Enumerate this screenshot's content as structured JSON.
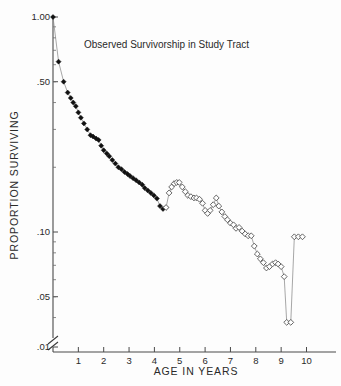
{
  "chart_data": {
    "type": "line",
    "title": "Observed Survivorship in Study Tract",
    "xlabel": "AGE IN YEARS",
    "ylabel": "PROPORTION SURVIVING",
    "xlim": [
      0,
      10.6
    ],
    "ylim": [
      0.01,
      1.0
    ],
    "yscale": "log",
    "grid": false,
    "legend": false,
    "axis_break": "y-axis break between .01 and .03",
    "ytick_labels": [
      "1.00",
      ".50",
      ".10",
      ".05",
      ".01"
    ],
    "ytick_values": [
      1.0,
      0.5,
      0.1,
      0.05,
      0.01
    ],
    "xtick_labels": [
      "1",
      "2",
      "3",
      "4",
      "5",
      "6",
      "7",
      "8",
      "9",
      "10"
    ],
    "xtick_values": [
      1,
      2,
      3,
      4,
      5,
      6,
      7,
      8,
      9,
      10
    ],
    "series": [
      {
        "name": "Observed survivorship (censused ages)",
        "marker": "filled-diamond",
        "x": [
          0.0,
          0.22,
          0.42,
          0.58,
          0.7,
          0.8,
          0.9,
          1.0,
          1.1,
          1.22,
          1.35,
          1.48,
          1.58,
          1.7,
          1.8,
          1.9,
          2.0,
          2.12,
          2.22,
          2.34,
          2.46,
          2.58,
          2.7,
          2.82,
          2.94,
          3.04,
          3.16,
          3.28,
          3.4,
          3.52,
          3.62,
          3.74,
          3.86,
          3.98,
          4.1,
          4.22,
          4.34,
          4.46
        ],
        "y": [
          1.0,
          0.62,
          0.5,
          0.445,
          0.42,
          0.4,
          0.385,
          0.36,
          0.34,
          0.32,
          0.3,
          0.282,
          0.278,
          0.272,
          0.268,
          0.252,
          0.24,
          0.232,
          0.225,
          0.216,
          0.208,
          0.2,
          0.196,
          0.19,
          0.186,
          0.182,
          0.178,
          0.174,
          0.17,
          0.166,
          0.16,
          0.156,
          0.152,
          0.148,
          0.143,
          0.132,
          0.128,
          0.13
        ]
      },
      {
        "name": "Observed survivorship (estimated ages)",
        "marker": "open-diamond",
        "x": [
          4.46,
          4.58,
          4.68,
          4.78,
          4.88,
          4.98,
          5.1,
          5.22,
          5.32,
          5.44,
          5.56,
          5.66,
          5.78,
          5.9,
          6.0,
          6.1,
          6.2,
          6.32,
          6.44,
          6.54,
          6.66,
          6.78,
          6.88,
          7.0,
          7.12,
          7.22,
          7.34,
          7.46,
          7.58,
          7.7,
          7.82,
          7.94,
          8.06,
          8.18,
          8.3,
          8.42,
          8.54,
          8.66,
          8.78,
          8.88,
          9.0,
          9.12,
          9.22,
          9.38,
          9.52,
          9.68,
          9.84
        ],
        "y": [
          0.13,
          0.152,
          0.162,
          0.168,
          0.17,
          0.17,
          0.162,
          0.154,
          0.148,
          0.146,
          0.144,
          0.144,
          0.142,
          0.136,
          0.126,
          0.122,
          0.126,
          0.134,
          0.144,
          0.132,
          0.124,
          0.118,
          0.114,
          0.11,
          0.108,
          0.104,
          0.105,
          0.101,
          0.098,
          0.096,
          0.096,
          0.086,
          0.079,
          0.075,
          0.072,
          0.068,
          0.069,
          0.071,
          0.072,
          0.071,
          0.069,
          0.062,
          0.038,
          0.038,
          0.095,
          0.095,
          0.095
        ]
      }
    ]
  }
}
